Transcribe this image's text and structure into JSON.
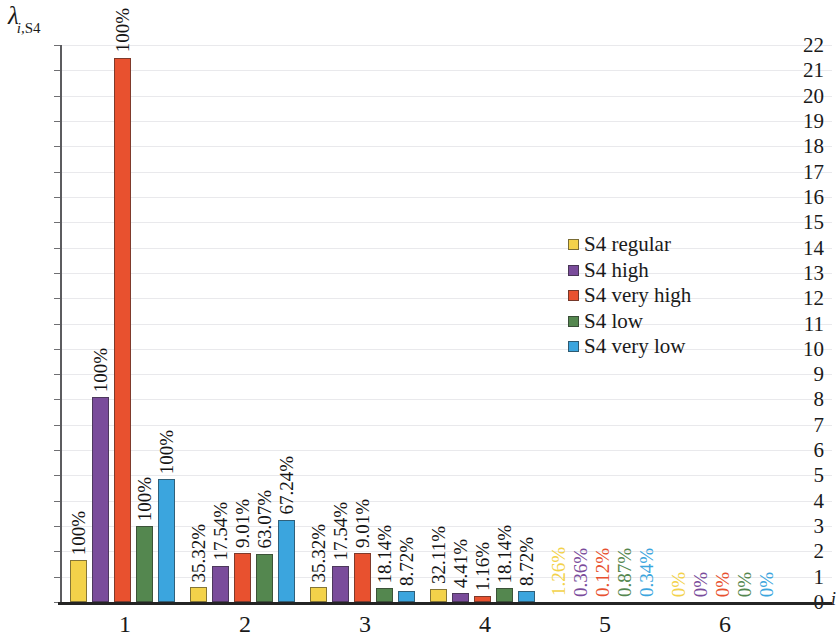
{
  "chart_data": {
    "type": "bar",
    "title": "",
    "ylabel": "λ",
    "ylabel_sub": "i,",
    "ylabel_sub2": "S4",
    "xlabel": "i",
    "categories": [
      "1",
      "2",
      "3",
      "4",
      "5",
      "6"
    ],
    "ylim": [
      0,
      22
    ],
    "ytick_step": 1,
    "yticks": [
      "0",
      "1",
      "2",
      "3",
      "4",
      "5",
      "6",
      "7",
      "8",
      "9",
      "10",
      "11",
      "12",
      "13",
      "14",
      "15",
      "16",
      "17",
      "18",
      "19",
      "20",
      "21",
      "22"
    ],
    "grid": "horizontal",
    "legend_position": "center-right",
    "series": [
      {
        "name": "S4 regular",
        "color": "#F3D24A",
        "values": [
          1.65,
          0.58,
          0.58,
          0.53,
          0.02,
          0
        ],
        "labels": [
          "100%",
          "35.32%",
          "35.32%",
          "32.11%",
          "1.26%",
          "0%"
        ]
      },
      {
        "name": "S4 high",
        "color": "#7A4C9B",
        "values": [
          8.1,
          1.42,
          1.42,
          0.35,
          0.01,
          0
        ],
        "labels": [
          "100%",
          "17.54%",
          "17.54%",
          "4.41%",
          "0.36%",
          "0%"
        ]
      },
      {
        "name": "S4 very high",
        "color": "#E8512F",
        "values": [
          21.5,
          1.95,
          1.95,
          0.25,
          0.01,
          0
        ],
        "labels": [
          "100%",
          "9.01%",
          "9.01%",
          "1.16%",
          "0.12%",
          "0%"
        ]
      },
      {
        "name": "S4 low",
        "color": "#54874F",
        "values": [
          3.0,
          1.9,
          0.55,
          0.55,
          0.01,
          0
        ],
        "labels": [
          "100%",
          "63.07%",
          "18.14%",
          "18.14%",
          "0.87%",
          "0%"
        ]
      },
      {
        "name": "S4 very low",
        "color": "#3BA5DE",
        "values": [
          4.85,
          3.25,
          0.42,
          0.42,
          0.01,
          0
        ],
        "labels": [
          "100%",
          "67.24%",
          "8.72%",
          "8.72%",
          "0.34%",
          "0%"
        ]
      }
    ]
  },
  "legend": {
    "items": [
      {
        "label": "S4 regular",
        "color": "#F3D24A"
      },
      {
        "label": "S4 high",
        "color": "#7A4C9B"
      },
      {
        "label": "S4 very high",
        "color": "#E8512F"
      },
      {
        "label": "S4 low",
        "color": "#54874F"
      },
      {
        "label": "S4 very low",
        "color": "#3BA5DE"
      }
    ]
  }
}
